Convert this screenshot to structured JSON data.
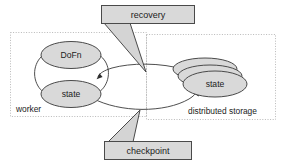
{
  "diagram": {
    "type": "flow-diagram",
    "colors": {
      "node_fill": "#d9d9d9",
      "node_stroke": "#4a4a4a",
      "zone_stroke": "#b9b9b9",
      "callout_fill": "#d9d9d9",
      "arrow": "#3a3a3a",
      "background": "#ffffff"
    },
    "zones": [
      {
        "id": "worker",
        "label": "worker"
      },
      {
        "id": "distributed-storage",
        "label": "distributed storage"
      }
    ],
    "nodes": [
      {
        "id": "dofn",
        "label": "DoFn",
        "zone": "worker",
        "shape": "ellipse"
      },
      {
        "id": "worker-state",
        "label": "state",
        "zone": "worker",
        "shape": "ellipse"
      },
      {
        "id": "storage-state",
        "label": "state",
        "zone": "distributed-storage",
        "shape": "stacked-ellipse",
        "stack_count": 3
      }
    ],
    "callouts": [
      {
        "id": "recovery",
        "label": "recovery",
        "points_to": "storage-to-worker-arrow"
      },
      {
        "id": "checkpoint",
        "label": "checkpoint",
        "points_to": "worker-to-storage-arrow"
      }
    ],
    "edges": [
      {
        "id": "dofn-to-state",
        "from": "dofn",
        "to": "worker-state",
        "style": "curved",
        "arrow": "end"
      },
      {
        "id": "state-to-dofn",
        "from": "worker-state",
        "to": "dofn",
        "style": "curved",
        "arrow": "end"
      },
      {
        "id": "storage-to-worker-arrow",
        "from": "storage-state",
        "to": "worker-state",
        "style": "curved",
        "arrow": "end",
        "annotated_by": "recovery"
      },
      {
        "id": "worker-to-storage-arrow",
        "from": "worker-state",
        "to": "storage-state",
        "style": "curved",
        "arrow": "end",
        "annotated_by": "checkpoint"
      }
    ]
  }
}
